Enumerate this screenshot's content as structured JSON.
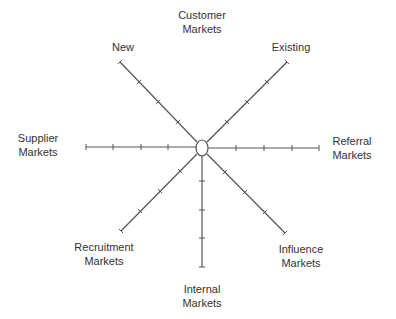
{
  "diagram": {
    "center": {
      "x": 202,
      "y": 148,
      "rx": 6,
      "ry": 8
    },
    "line_color": "#555555",
    "text_color": "#333333",
    "spokes": [
      {
        "name": "spoke-new",
        "x1": 197,
        "y1": 142,
        "x2": 120,
        "y2": 62,
        "ticks": [
          [
            178,
            122
          ],
          [
            158,
            102
          ],
          [
            139,
            82
          ]
        ]
      },
      {
        "name": "spoke-existing",
        "x1": 207,
        "y1": 142,
        "x2": 287,
        "y2": 62,
        "ticks": [
          [
            227,
            122
          ],
          [
            247,
            102
          ],
          [
            267,
            82
          ]
        ]
      },
      {
        "name": "spoke-supplier",
        "x1": 196,
        "y1": 147,
        "x2": 86,
        "y2": 147,
        "ticks": [
          [
            168,
            147
          ],
          [
            141,
            147
          ],
          [
            113,
            147
          ]
        ]
      },
      {
        "name": "spoke-referral",
        "x1": 208,
        "y1": 148,
        "x2": 319,
        "y2": 148,
        "ticks": [
          [
            236,
            148
          ],
          [
            264,
            148
          ],
          [
            292,
            148
          ]
        ]
      },
      {
        "name": "spoke-recruitment",
        "x1": 197,
        "y1": 154,
        "x2": 121,
        "y2": 231,
        "ticks": [
          [
            180,
            171
          ],
          [
            160,
            191
          ],
          [
            140,
            211
          ]
        ]
      },
      {
        "name": "spoke-influence",
        "x1": 207,
        "y1": 154,
        "x2": 285,
        "y2": 233,
        "ticks": [
          [
            225,
            172
          ],
          [
            245,
            192
          ],
          [
            265,
            212
          ]
        ]
      },
      {
        "name": "spoke-internal",
        "x1": 202,
        "y1": 156,
        "x2": 202,
        "y2": 267,
        "ticks": [
          [
            202,
            181
          ],
          [
            202,
            210
          ],
          [
            202,
            238
          ]
        ]
      }
    ],
    "labels": {
      "customer": {
        "line1": "Customer",
        "line2": "Markets"
      },
      "new": {
        "line1": "New"
      },
      "existing": {
        "line1": "Existing"
      },
      "supplier": {
        "line1": "Supplier",
        "line2": "Markets"
      },
      "referral": {
        "line1": "Referral",
        "line2": "Markets"
      },
      "recruitment": {
        "line1": "Recruitment",
        "line2": "Markets"
      },
      "influence": {
        "line1": "Influence",
        "line2": "Markets"
      },
      "internal": {
        "line1": "Internal",
        "line2": "Markets"
      }
    }
  }
}
